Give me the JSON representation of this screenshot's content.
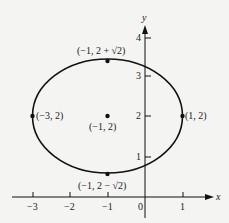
{
  "diagram": {
    "type": "ellipse-graph",
    "axes": {
      "x_label": "x",
      "y_label": "y",
      "x_ticks": [
        "−3",
        "−2",
        "−1",
        "0",
        "1"
      ],
      "y_ticks": [
        "1",
        "2",
        "3",
        "4"
      ]
    },
    "ellipse": {
      "center": [
        -1,
        2
      ],
      "semi_major_x": 2,
      "semi_minor_y": 1.414
    },
    "points": {
      "top": "(−1, 2 + √2)",
      "bottom": "(−1, 2 − √2)",
      "left": "(−3, 2)",
      "right": "(1, 2)",
      "center": "(−1, 2)"
    },
    "colors": {
      "ink": "#111111",
      "background": "#f4f4f2"
    }
  }
}
